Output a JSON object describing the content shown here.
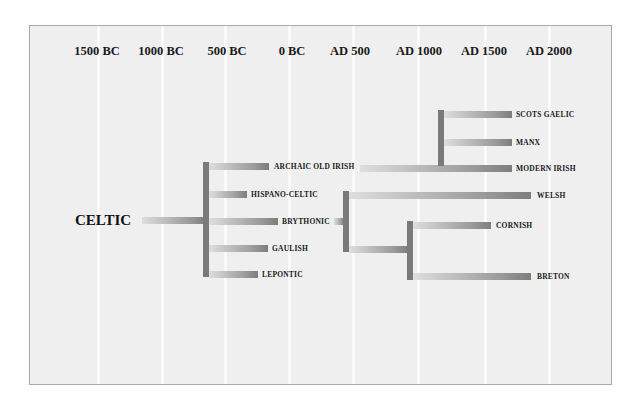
{
  "diagram": {
    "timeline": [
      {
        "label": "1500 BC",
        "x": 97
      },
      {
        "label": "1000 BC",
        "x": 161
      },
      {
        "label": "500 BC",
        "x": 224
      },
      {
        "label": "0 BC",
        "x": 288
      },
      {
        "label": "AD 500",
        "x": 352
      },
      {
        "label": "AD 1000",
        "x": 417
      },
      {
        "label": "AD 1500",
        "x": 484
      },
      {
        "label": "AD 2000",
        "x": 548
      }
    ],
    "root": {
      "label": "CELTIC"
    },
    "branches": {
      "archaic_old_irish": "ARCHAIC OLD IRISH",
      "hispano_celtic": "HISPANO-CELTIC",
      "brythonic": "BRYTHONIC",
      "gaulish": "GAULISH",
      "lepontic": "LEPONTIC",
      "scots_gaelic": "SCOTS GAELIC",
      "manx": "MANX",
      "modern_irish": "MODERN IRISH",
      "welsh": "WELSH",
      "cornish": "CORNISH",
      "breton": "BRETON"
    },
    "colors": {
      "background": "#efefef",
      "gridline": "#fafafa",
      "branch_dark": "#7a7a7a",
      "branch_light": "#dedede",
      "text": "#1a1a1a"
    }
  }
}
